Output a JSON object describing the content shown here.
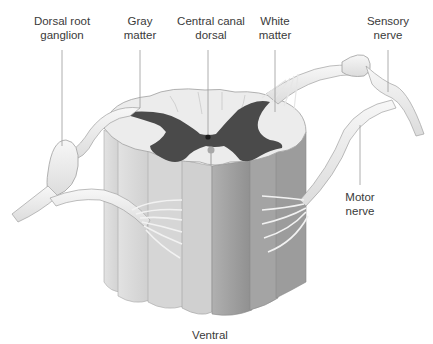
{
  "diagram": {
    "labels": {
      "dorsal_root_ganglion": "Dorsal root\nganglion",
      "gray_matter": "Gray\nmatter",
      "central_canal": "Central canal\ndorsal",
      "white_matter": "White\nmatter",
      "sensory_nerve": "Sensory\nnerve",
      "motor_nerve": "Motor\nnerve",
      "ventral": "Ventral"
    },
    "colors": {
      "gray_matter": "#4a4a4a",
      "white_matter": "#ececec",
      "column_light": "#d8d8d8",
      "column_dark": "#9a9a9a",
      "nerve": "#efefef",
      "outline": "#9c9c9c",
      "leader_line": "#9a9a9a"
    }
  }
}
